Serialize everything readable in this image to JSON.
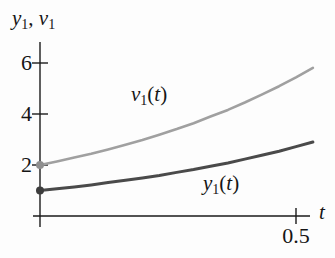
{
  "figure": {
    "background": "#fdfdfd",
    "axis_color": "#1a1a1a",
    "text_color": "#151515"
  },
  "labels": {
    "axis_title": {
      "p1": "y",
      "s1": "1",
      "p2": ", ",
      "p3": "v",
      "s2": "1"
    },
    "v_curve": {
      "p1": "v",
      "s1": "1",
      "p2": "(",
      "p3": "t",
      "p4": ")"
    },
    "y_curve": {
      "p1": "y",
      "s1": "1",
      "p2": "(",
      "p3": "t",
      "p4": ")"
    },
    "x_axis": "t"
  },
  "chart_data": {
    "type": "line",
    "title": "",
    "xlabel": "t",
    "ylabel": "y1, v1",
    "x": [
      0,
      0.033,
      0.067,
      0.1,
      0.133,
      0.167,
      0.2,
      0.233,
      0.267,
      0.3,
      0.333,
      0.367,
      0.4,
      0.433,
      0.467,
      0.5,
      0.533
    ],
    "series": [
      {
        "name": "v1(t)",
        "color": "#a0a0a0",
        "width": 2.6,
        "values": [
          2.0,
          2.14,
          2.29,
          2.44,
          2.61,
          2.79,
          2.98,
          3.19,
          3.41,
          3.64,
          3.9,
          4.16,
          4.45,
          4.76,
          5.09,
          5.44,
          5.81
        ]
      },
      {
        "name": "y1(t)",
        "color": "#4a4a4a",
        "width": 3,
        "values": [
          1.0,
          1.07,
          1.14,
          1.22,
          1.31,
          1.4,
          1.49,
          1.59,
          1.71,
          1.82,
          1.95,
          2.08,
          2.23,
          2.38,
          2.54,
          2.72,
          2.9
        ]
      }
    ],
    "start_markers": [
      {
        "series": "v1(t)",
        "t": 0,
        "value": 2,
        "color": "#8f8f8f"
      },
      {
        "series": "y1(t)",
        "t": 0,
        "value": 1,
        "color": "#3d3d3d"
      }
    ],
    "yticks": [
      6,
      4,
      2
    ],
    "xticks": [
      0.5
    ],
    "xlim": [
      0,
      0.54
    ],
    "ylim": [
      0,
      6.8
    ],
    "grid": false,
    "legend": "inline-annotations"
  }
}
